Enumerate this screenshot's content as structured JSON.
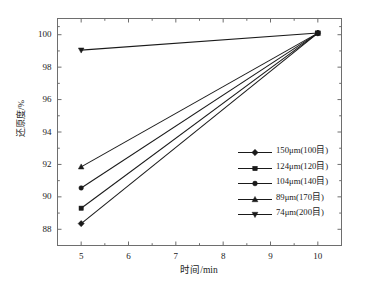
{
  "chart_data": {
    "type": "line",
    "title": "",
    "xlabel": "时间/min",
    "ylabel": "还原度/%",
    "xlim": [
      4.5,
      10.5
    ],
    "ylim": [
      87.0,
      101.0
    ],
    "xticks": [
      5,
      6,
      7,
      8,
      9,
      10
    ],
    "yticks": [
      88,
      90,
      92,
      94,
      96,
      98,
      100
    ],
    "xtick_labels": [
      "5",
      "6",
      "7",
      "8",
      "9",
      "10"
    ],
    "ytick_labels": [
      "88",
      "90",
      "92",
      "94",
      "96",
      "98",
      "100"
    ],
    "grid": false,
    "legend_position": "center-right",
    "x": [
      5,
      10
    ],
    "series": [
      {
        "name": "150μm(100目)",
        "marker": "diamond",
        "values": [
          88.35,
          100.1
        ],
        "color": "#1a1a1a"
      },
      {
        "name": "124μm(120目)",
        "marker": "square",
        "values": [
          89.3,
          100.1
        ],
        "color": "#1a1a1a"
      },
      {
        "name": "104μm(140目)",
        "marker": "circle",
        "values": [
          90.55,
          100.1
        ],
        "color": "#1a1a1a"
      },
      {
        "name": "89μm(170目)",
        "marker": "triangle-up",
        "values": [
          91.85,
          100.1
        ],
        "color": "#1a1a1a"
      },
      {
        "name": "74μm(200目)",
        "marker": "triangle-down",
        "values": [
          99.05,
          100.1
        ],
        "color": "#1a1a1a"
      }
    ]
  },
  "axes": {
    "y_title": "还原度/%",
    "x_title": "时间/min"
  },
  "legend": {
    "entries": [
      {
        "label": "150μm(100目)"
      },
      {
        "label": "124μm(120目)"
      },
      {
        "label": "104μm(140目)"
      },
      {
        "label": "89μm(170目)"
      },
      {
        "label": "74μm(200目)"
      }
    ]
  },
  "style": {
    "line_color": "#1a1a1a",
    "frame_color": "#6e6e6e",
    "background": "#ffffff"
  }
}
